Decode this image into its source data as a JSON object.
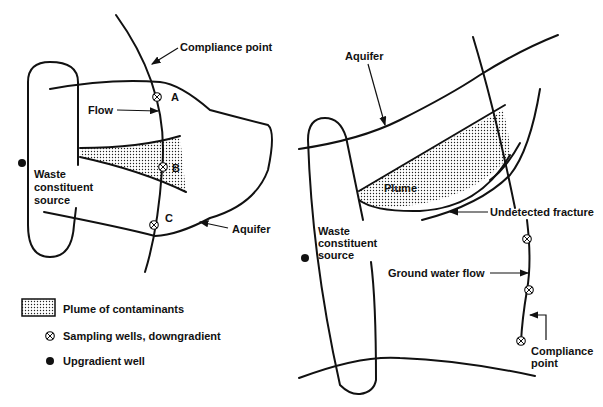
{
  "left_diagram": {
    "labels": {
      "compliance_point": "Compliance point",
      "flow": "Flow",
      "well_a": "A",
      "well_b": "B",
      "well_c": "C",
      "source_line1": "Waste",
      "source_line2": "constituent",
      "source_line3": "source",
      "aquifer": "Aquifer"
    }
  },
  "right_diagram": {
    "labels": {
      "aquifer": "Aquifer",
      "plume": "Plume",
      "fracture": "Undetected fracture",
      "source_line1": "Waste",
      "source_line2": "constituent",
      "source_line3": "source",
      "gw_flow": "Ground water flow",
      "compliance_line1": "Compliance",
      "compliance_line2": "point"
    }
  },
  "legend": {
    "items": [
      {
        "icon": "dotted-plume-swatch",
        "label": "Plume of contaminants"
      },
      {
        "icon": "crossed-circle-icon",
        "label": "Sampling wells, downgradient"
      },
      {
        "icon": "filled-circle-icon",
        "label": "Upgradient well"
      }
    ]
  },
  "colors": {
    "ink": "#111111",
    "background": "#ffffff"
  }
}
